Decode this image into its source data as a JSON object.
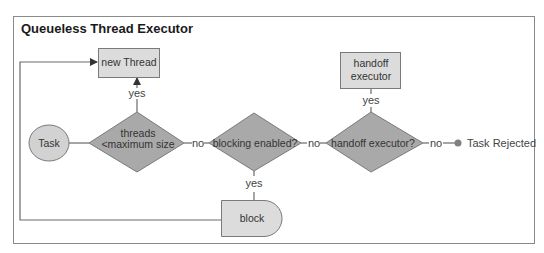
{
  "diagram": {
    "title": "Queueless Thread Executor",
    "colors": {
      "frame": "#8a8a8a",
      "decision_fill": "#a9a9a9",
      "process_fill": "#dcdcdc",
      "terminal_fill": "#d2d2d2",
      "line": "#6a6a6a",
      "reject_dot": "#808080"
    },
    "nodes": {
      "task": {
        "label": "Task",
        "shape": "ellipse"
      },
      "threads_check": {
        "line1": "threads",
        "line2": "<maximum size",
        "shape": "diamond"
      },
      "new_thread": {
        "label": "new Thread",
        "shape": "rectangle"
      },
      "blocking_check": {
        "label": "blocking enabled?",
        "shape": "diamond"
      },
      "block": {
        "label": "block",
        "shape": "delay"
      },
      "handoff_check": {
        "label": "handoff executor?",
        "shape": "diamond"
      },
      "handoff_executor": {
        "line1": "handoff",
        "line2": "executor",
        "shape": "rectangle"
      },
      "task_rejected": {
        "label": "Task Rejected",
        "shape": "dot"
      }
    },
    "edges": {
      "threads_yes": "yes",
      "threads_no": "no",
      "blocking_yes": "yes",
      "blocking_no": "no",
      "handoff_yes": "yes",
      "handoff_no": "no"
    }
  }
}
